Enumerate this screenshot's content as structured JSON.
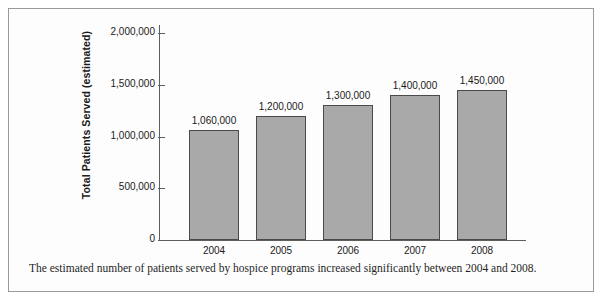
{
  "figure": {
    "caption": "The estimated number of patients served by hospice programs increased significantly between 2004 and 2008.",
    "border_color": "#9a9a9a",
    "background_color": "#fdfdfd"
  },
  "chart_data": {
    "type": "bar",
    "title": "",
    "xlabel": "",
    "ylabel": "Total Patients Served (estimated)",
    "categories": [
      "2004",
      "2005",
      "2006",
      "2007",
      "2008"
    ],
    "values": [
      1060000,
      1200000,
      1300000,
      1400000,
      1450000
    ],
    "value_labels": [
      "1,060,000",
      "1,200,000",
      "1,300,000",
      "1,400,000",
      "1,450,000"
    ],
    "ylim": [
      0,
      2000000
    ],
    "yticks": [
      0,
      500000,
      1000000,
      1500000,
      2000000
    ],
    "ytick_labels": [
      "0",
      "500,000",
      "1,000,000",
      "1,500,000",
      "2,000,000"
    ],
    "grid": false,
    "legend": false,
    "bar_color": "#a9a9a9",
    "bar_edge_color": "#4a4a4a",
    "axis_color": "#5e5e5e"
  }
}
